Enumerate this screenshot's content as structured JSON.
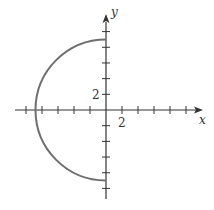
{
  "chart_data": {
    "type": "line",
    "title": "",
    "xlabel": "x",
    "ylabel": "y",
    "tick_step": 2,
    "x_tick_label": "2",
    "y_tick_label": "2",
    "xlim": [
      -11,
      12
    ],
    "ylim": [
      -11,
      11
    ],
    "grid": false,
    "legend": null,
    "series": [
      {
        "name": "left semicircle x = -sqrt(81 - y^2)",
        "radius": 9,
        "center": [
          0,
          0
        ],
        "x": [
          0,
          -3.08,
          -5.79,
          -7.79,
          -8.86,
          -9,
          -8.86,
          -7.79,
          -5.79,
          -3.08,
          0
        ],
        "y": [
          9,
          8.46,
          6.89,
          4.5,
          1.56,
          0,
          -1.56,
          -4.5,
          -6.89,
          -8.46,
          -9
        ]
      }
    ]
  },
  "labels": {
    "x_axis": "x",
    "y_axis": "y",
    "x_tick": "2",
    "y_tick": "2"
  },
  "colors": {
    "axis": "#333333",
    "curve": "#6e6e6e"
  }
}
